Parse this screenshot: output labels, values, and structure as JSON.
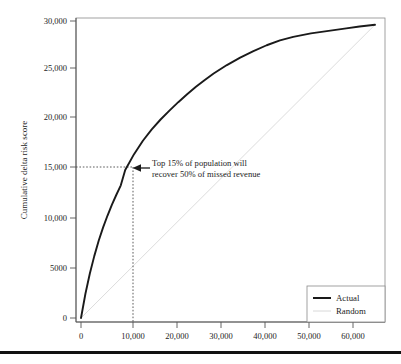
{
  "chart_data": {
    "type": "line",
    "title": "",
    "xlabel": "",
    "ylabel": "Cumulative delta risk score",
    "xlim": [
      -2500,
      69000
    ],
    "ylim": [
      -1200,
      31200
    ],
    "xticks": [
      0,
      10000,
      20000,
      30000,
      40000,
      50000,
      60000
    ],
    "xtick_labels": [
      "0",
      "10,000",
      "20,000",
      "30,000",
      "40,000",
      "50,000",
      "60,000"
    ],
    "yticks": [
      0,
      5000,
      10000,
      15000,
      20000,
      25000,
      30000
    ],
    "ytick_labels": [
      "0",
      "5000",
      "10,000",
      "15,000",
      "20,000",
      "25,000",
      "30,000"
    ],
    "grid": false,
    "legend_position": "lower right",
    "series": [
      {
        "name": "Actual",
        "color": "#1a1a1a",
        "width": 1.9,
        "x": [
          0,
          1000,
          2000,
          3000,
          4000,
          5000,
          6000,
          7000,
          8000,
          9000,
          10000,
          12000,
          14000,
          16000,
          18000,
          20000,
          22000,
          24000,
          26000,
          28000,
          30000,
          33000,
          36000,
          39000,
          42000,
          45000,
          48000,
          52000,
          56000,
          60000,
          63000,
          66500
        ],
        "y": [
          0,
          2450,
          4500,
          6250,
          7800,
          9150,
          10350,
          11450,
          12450,
          13400,
          14950,
          16550,
          17900,
          19050,
          20050,
          20950,
          21800,
          22600,
          23350,
          24050,
          24700,
          25550,
          26300,
          26950,
          27550,
          28050,
          28400,
          28750,
          29000,
          29250,
          29450,
          29620
        ]
      },
      {
        "name": "Random",
        "color": "#d8d8d8",
        "width": 0.9,
        "x": [
          0,
          66500
        ],
        "y": [
          0,
          29620
        ]
      }
    ],
    "annotations": [
      {
        "name": "callout",
        "lines": [
          "Top 15% of population will",
          "recover 50% of missed revenue"
        ],
        "arrow_target_x": 10000,
        "arrow_target_y": 15000
      }
    ],
    "guides": [
      {
        "name": "horizontal-guide",
        "type": "dotted",
        "value": 15000,
        "from_x": 0,
        "to_x": 10000
      },
      {
        "name": "vertical-guide",
        "type": "dotted",
        "value": 10000,
        "from_y": 0,
        "to_y": 15000
      }
    ],
    "legend": [
      {
        "label": "Actual",
        "color": "#1a1a1a",
        "width": 2.0
      },
      {
        "label": "Random",
        "color": "#d8d8d8",
        "width": 1.0
      }
    ]
  }
}
